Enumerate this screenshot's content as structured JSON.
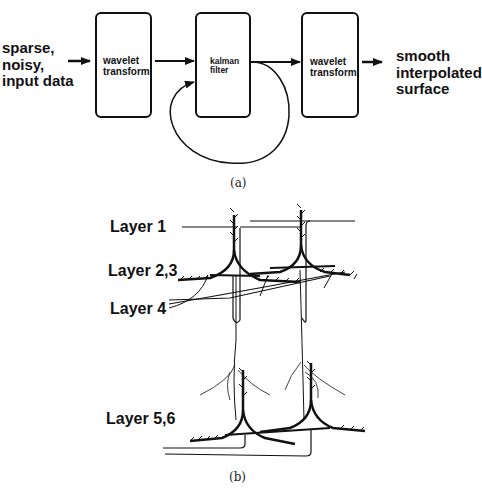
{
  "panel_a": {
    "input_label": "sparse,\nnoisy,\ninput data",
    "boxes": [
      {
        "label": "wavelet\ntransform"
      },
      {
        "label": "kalman\nfilter"
      },
      {
        "label": "wavelet\ntransform"
      }
    ],
    "output_label": "smooth\ninterpolated\nsurface",
    "caption": "(a)"
  },
  "panel_b": {
    "layers": [
      {
        "label": "Layer 1"
      },
      {
        "label": "Layer 2,3"
      },
      {
        "label": "Layer 4"
      },
      {
        "label": "Layer 5,6"
      }
    ],
    "caption": "(b)"
  }
}
